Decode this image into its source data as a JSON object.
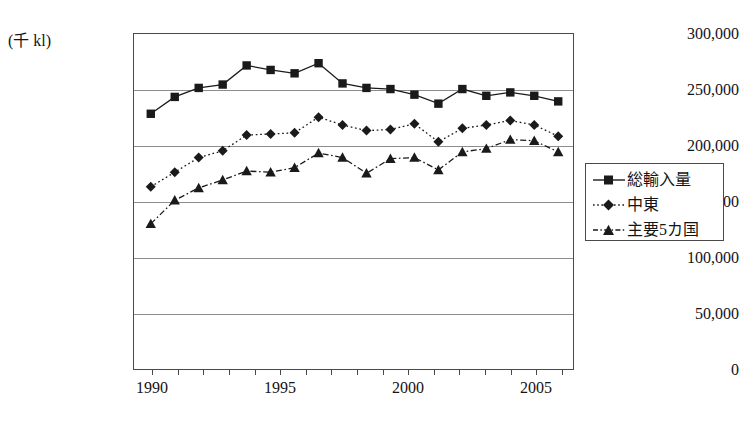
{
  "chart_data": {
    "type": "line",
    "title": "",
    "subtitle": "",
    "xlabel": "",
    "ylabel": "",
    "unit_label": "(千 kl)",
    "x": [
      1990,
      1991,
      1992,
      1993,
      1994,
      1995,
      1996,
      1997,
      1998,
      1999,
      2000,
      2001,
      2002,
      2003,
      2004,
      2005,
      2006,
      2007
    ],
    "xlim": [
      1989.3,
      2007.7
    ],
    "ylim": [
      0,
      300000
    ],
    "ytick_labels": [
      "300,000",
      "250,000",
      "200,000",
      "150,000",
      "100,000",
      "50,000",
      "0"
    ],
    "ytick_values": [
      300000,
      250000,
      200000,
      150000,
      100000,
      50000,
      0
    ],
    "xtick_labels": [
      "1990",
      "1995",
      "2000",
      "2005"
    ],
    "xtick_values": [
      1990,
      1995,
      2000,
      2005
    ],
    "grid": "horizontal",
    "legend_position": "right-outside",
    "series": [
      {
        "name": "総輸入量",
        "marker": "square",
        "line_style": "solid",
        "color": "#1a1a1a",
        "values": [
          229000,
          244000,
          252000,
          255000,
          272000,
          268000,
          265000,
          274000,
          256000,
          252000,
          251000,
          246000,
          238000,
          251000,
          245000,
          248000,
          245000,
          240000
        ]
      },
      {
        "name": "中東",
        "marker": "diamond",
        "line_style": "dotted",
        "color": "#1a1a1a",
        "values": [
          164000,
          177000,
          190000,
          196000,
          210000,
          211000,
          212000,
          226000,
          219000,
          214000,
          215000,
          220000,
          204000,
          216000,
          219000,
          223000,
          219000,
          209000
        ]
      },
      {
        "name": "主要5カ国",
        "marker": "triangle",
        "line_style": "dashdot",
        "color": "#1a1a1a",
        "values": [
          131000,
          152000,
          163000,
          170000,
          178000,
          177000,
          181000,
          194000,
          190000,
          176000,
          189000,
          190000,
          179000,
          195000,
          198000,
          206000,
          205000,
          195000
        ]
      }
    ]
  },
  "legend": {
    "items": [
      {
        "label": "総輸入量"
      },
      {
        "label": "中東"
      },
      {
        "label": "主要5カ国"
      }
    ]
  }
}
